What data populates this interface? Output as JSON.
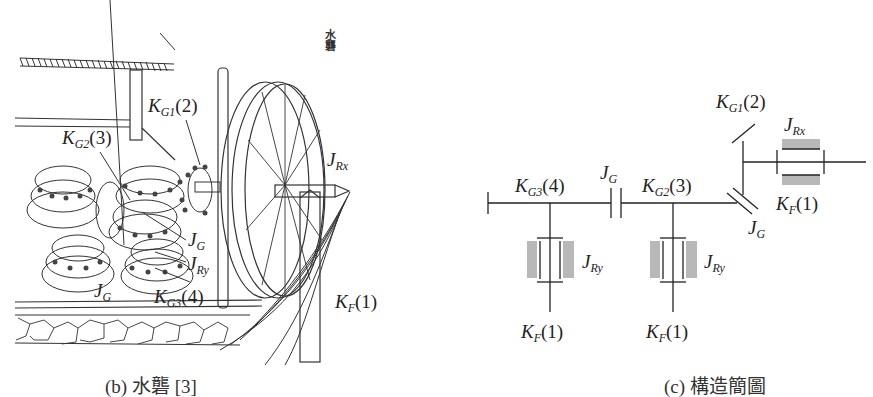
{
  "figure_b": {
    "caption": "(b) 水礱 [3]",
    "vertical_title": "水礱",
    "labels": {
      "kg1": {
        "main": "K",
        "sub": "G1",
        "tail": "(2)"
      },
      "kg2": {
        "main": "K",
        "sub": "G2",
        "tail": "(3)"
      },
      "jrx": {
        "main": "J",
        "sub": "Rx",
        "tail": ""
      },
      "jg1": {
        "main": "J",
        "sub": "G",
        "tail": ""
      },
      "jry": {
        "main": "J",
        "sub": "Ry",
        "tail": ""
      },
      "jg2": {
        "main": "J",
        "sub": "G",
        "tail": ""
      },
      "kg3": {
        "main": "K",
        "sub": "G3",
        "tail": "(4)"
      },
      "kf": {
        "main": "K",
        "sub": "F",
        "tail": "(1)"
      }
    }
  },
  "figure_c": {
    "caption": "(c) 構造簡圖",
    "labels": {
      "kg1": {
        "main": "K",
        "sub": "G1",
        "tail": "(2)"
      },
      "jrx": {
        "main": "J",
        "sub": "Rx",
        "tail": ""
      },
      "kf_top": {
        "main": "K",
        "sub": "F",
        "tail": "(1)"
      },
      "jg_top": {
        "main": "J",
        "sub": "G",
        "tail": ""
      },
      "kg3": {
        "main": "K",
        "sub": "G3",
        "tail": "(4)"
      },
      "jg_mid": {
        "main": "J",
        "sub": "G",
        "tail": ""
      },
      "kg2": {
        "main": "K",
        "sub": "G2",
        "tail": "(3)"
      },
      "jg_diag": {
        "main": "J",
        "sub": "G",
        "tail": ""
      },
      "jry_left": {
        "main": "J",
        "sub": "Ry",
        "tail": ""
      },
      "jry_right": {
        "main": "J",
        "sub": "Ry",
        "tail": ""
      },
      "kf_left": {
        "main": "K",
        "sub": "F",
        "tail": "(1)"
      },
      "kf_right": {
        "main": "K",
        "sub": "F",
        "tail": "(1)"
      }
    },
    "colors": {
      "line": "#222222",
      "bearing_fill": "#b8b8b8"
    }
  }
}
